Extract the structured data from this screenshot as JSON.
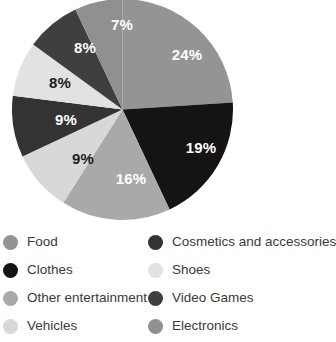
{
  "chart_data": {
    "type": "pie",
    "title": "",
    "subtitle": "",
    "xlabel": "",
    "ylabel": "",
    "legend_position": "bottom",
    "grid": false,
    "start_angle_deg": 0,
    "direction": "clockwise",
    "total": 100,
    "unit": "%",
    "categories": [
      "Food",
      "Clothes",
      "Other entertainment",
      "Vehicles",
      "Cosmetics and accessories",
      "Shoes",
      "Video Games",
      "Electronics"
    ],
    "values": [
      24,
      19,
      16,
      9,
      9,
      8,
      8,
      7
    ],
    "labels": [
      "24%",
      "19%",
      "16%",
      "9%",
      "9%",
      "8%",
      "8%",
      "7%"
    ],
    "colors": [
      "#949494",
      "#141414",
      "#a9a9a9",
      "#d8d8d8",
      "#333333",
      "#e2e2e2",
      "#3f3f3f",
      "#909090"
    ],
    "slices": [
      {
        "name": "Food",
        "value": 24,
        "label": "24%",
        "color": "#949494",
        "label_color": "#ffffff",
        "lx": 175,
        "ly": 57
      },
      {
        "name": "Clothes",
        "value": 19,
        "label": "19%",
        "color": "#141414",
        "label_color": "#ffffff",
        "lx": 189,
        "ly": 150
      },
      {
        "name": "Other entertainment",
        "value": 16,
        "label": "16%",
        "color": "#a9a9a9",
        "label_color": "#ffffff",
        "lx": 119,
        "ly": 181
      },
      {
        "name": "Vehicles",
        "value": 9,
        "label": "9%",
        "color": "#d8d8d8",
        "label_color": "#1c1c1c",
        "lx": 71,
        "ly": 161
      },
      {
        "name": "Cosmetics and accessories",
        "value": 9,
        "label": "9%",
        "color": "#333333",
        "label_color": "#ffffff",
        "lx": 54,
        "ly": 122
      },
      {
        "name": "Shoes",
        "value": 8,
        "label": "8%",
        "color": "#e2e2e2",
        "label_color": "#1c1c1c",
        "lx": 48,
        "ly": 85
      },
      {
        "name": "Video Games",
        "value": 8,
        "label": "8%",
        "color": "#3f3f3f",
        "label_color": "#ffffff",
        "lx": 73,
        "ly": 50
      },
      {
        "name": "Electronics",
        "value": 7,
        "label": "7%",
        "color": "#909090",
        "label_color": "#ffffff",
        "lx": 110,
        "ly": 27
      }
    ]
  },
  "legend": {
    "left_column": [
      {
        "label": "Food",
        "color": "#949494"
      },
      {
        "label": "Clothes",
        "color": "#141414"
      },
      {
        "label": "Other entertainment",
        "color": "#a9a9a9"
      },
      {
        "label": "Vehicles",
        "color": "#d8d8d8"
      }
    ],
    "right_column": [
      {
        "label": "Cosmetics and accessories",
        "color": "#333333"
      },
      {
        "label": "Shoes",
        "color": "#e2e2e2"
      },
      {
        "label": "Video Games",
        "color": "#3f3f3f"
      },
      {
        "label": "Electronics",
        "color": "#909090"
      }
    ]
  }
}
